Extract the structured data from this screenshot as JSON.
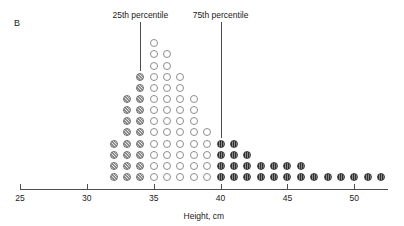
{
  "panel": {
    "letter": "B"
  },
  "axis": {
    "title": "Height, cm",
    "tick_labels": [
      "25",
      "30",
      "35",
      "40",
      "45",
      "50"
    ],
    "ticks": [
      25,
      30,
      35,
      40,
      45,
      50
    ],
    "range": [
      25,
      52.5
    ]
  },
  "annotations": [
    {
      "name": "p25",
      "label": "25th percentile",
      "x": 34
    },
    {
      "name": "p75",
      "label": "75th percentile",
      "x": 40
    }
  ],
  "legend_groups": [
    {
      "name": "below-p25",
      "style": "hatch",
      "color": "#8d8d8d"
    },
    {
      "name": "interquartile",
      "style": "open",
      "color": "#ffffff"
    },
    {
      "name": "above-p75",
      "style": "dark",
      "color": "#2f2f2f"
    }
  ],
  "chart_data": {
    "type": "bar",
    "subtype": "dot-plot",
    "title": "",
    "xlabel": "Height, cm",
    "ylabel": "",
    "xlim": [
      25,
      52.5
    ],
    "grid": false,
    "legend": "none",
    "categories": [
      32,
      33,
      34,
      35,
      36,
      37,
      38,
      39,
      40,
      41,
      42,
      43,
      44,
      45,
      46,
      47,
      48,
      49,
      50,
      51,
      52
    ],
    "values": [
      4,
      8,
      10,
      13,
      12,
      10,
      8,
      5,
      4,
      4,
      3,
      2,
      2,
      2,
      2,
      1,
      1,
      1,
      1,
      1,
      1
    ],
    "dot_styles": [
      "hatch",
      "hatch",
      "hatch",
      "open",
      "open",
      "open",
      "open",
      "open",
      "dark",
      "dark",
      "dark",
      "dark",
      "dark",
      "dark",
      "dark",
      "dark",
      "dark",
      "dark",
      "dark",
      "dark",
      "dark"
    ],
    "annotations": [
      {
        "label": "25th percentile",
        "x": 34
      },
      {
        "label": "75th percentile",
        "x": 40
      }
    ],
    "total_count": 75
  }
}
